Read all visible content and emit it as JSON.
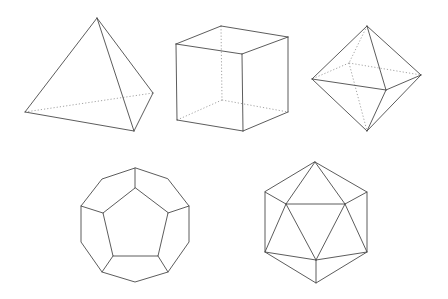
{
  "figure": {
    "background": "#ffffff",
    "edge_color": "#4a4a4a",
    "hidden_edge_color": "#9a9a9a",
    "solids": [
      {
        "name": "tetrahedron",
        "visible_edges": [
          [
            97,
            18,
            25,
            112
          ],
          [
            97,
            18,
            134,
            131
          ],
          [
            97,
            18,
            153,
            93
          ],
          [
            25,
            112,
            134,
            131
          ],
          [
            134,
            131,
            153,
            93
          ]
        ],
        "hidden_edges": [
          [
            25,
            112,
            153,
            93
          ]
        ]
      },
      {
        "name": "cube",
        "visible_edges": [
          [
            176,
            44,
            221,
            26
          ],
          [
            221,
            26,
            288,
            37
          ],
          [
            288,
            37,
            242,
            54
          ],
          [
            242,
            54,
            176,
            44
          ],
          [
            176,
            44,
            177,
            120
          ],
          [
            242,
            54,
            243,
            131
          ],
          [
            288,
            37,
            288,
            112
          ],
          [
            177,
            120,
            243,
            131
          ],
          [
            243,
            131,
            288,
            112
          ]
        ],
        "hidden_edges": [
          [
            221,
            26,
            222,
            100
          ],
          [
            222,
            100,
            177,
            120
          ],
          [
            222,
            100,
            288,
            112
          ]
        ]
      },
      {
        "name": "octahedron",
        "visible_edges": [
          [
            367,
            26,
            312,
            79
          ],
          [
            367,
            26,
            421,
            75
          ],
          [
            367,
            26,
            386,
            90
          ],
          [
            312,
            79,
            386,
            90
          ],
          [
            386,
            90,
            421,
            75
          ],
          [
            312,
            79,
            367,
            131
          ],
          [
            386,
            90,
            367,
            131
          ],
          [
            421,
            75,
            367,
            131
          ]
        ],
        "hidden_edges": [
          [
            367,
            26,
            349,
            63
          ],
          [
            349,
            63,
            312,
            79
          ],
          [
            349,
            63,
            421,
            75
          ],
          [
            349,
            63,
            367,
            131
          ]
        ]
      },
      {
        "name": "dodecahedron",
        "outer": [
          [
            135,
            168
          ],
          [
            102,
            179
          ],
          [
            81,
            206
          ],
          [
            81,
            242
          ],
          [
            102,
            272
          ],
          [
            135,
            282
          ],
          [
            168,
            272
          ],
          [
            189,
            242
          ],
          [
            189,
            206
          ],
          [
            168,
            179
          ]
        ],
        "inner": [
          [
            135,
            188
          ],
          [
            103,
            213
          ],
          [
            113,
            256
          ],
          [
            158,
            256
          ],
          [
            168,
            213
          ]
        ],
        "spokes": [
          [
            135,
            168,
            135,
            188
          ],
          [
            81,
            206,
            103,
            213
          ],
          [
            102,
            272,
            113,
            256
          ],
          [
            168,
            272,
            158,
            256
          ],
          [
            189,
            206,
            168,
            213
          ]
        ]
      },
      {
        "name": "icosahedron",
        "outer": [
          [
            315,
            162
          ],
          [
            367,
            192
          ],
          [
            367,
            252
          ],
          [
            316,
            283
          ],
          [
            265,
            252
          ],
          [
            265,
            192
          ]
        ],
        "edges": [
          [
            286,
            204,
            345,
            204
          ],
          [
            345,
            204,
            316,
            260
          ],
          [
            316,
            260,
            286,
            204
          ],
          [
            315,
            162,
            286,
            204
          ],
          [
            315,
            162,
            345,
            204
          ],
          [
            265,
            192,
            286,
            204
          ],
          [
            367,
            192,
            345,
            204
          ],
          [
            265,
            252,
            286,
            204
          ],
          [
            367,
            252,
            345,
            204
          ],
          [
            265,
            252,
            316,
            260
          ],
          [
            367,
            252,
            316,
            260
          ],
          [
            316,
            283,
            316,
            260
          ]
        ]
      }
    ]
  }
}
